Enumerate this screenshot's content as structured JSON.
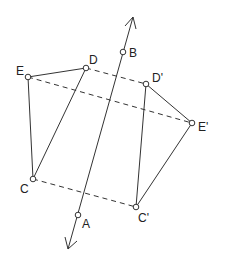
{
  "diagram": {
    "type": "reflection-across-line",
    "mirror_line": {
      "arrow_top": [
        133,
        17
      ],
      "arrow_bottom": [
        68,
        249
      ],
      "points_on_line": [
        "A",
        "B"
      ]
    },
    "points": {
      "A": {
        "label": "A",
        "x": 78,
        "y": 215
      },
      "B": {
        "label": "B",
        "x": 123,
        "y": 52
      },
      "C": {
        "label": "C",
        "x": 33,
        "y": 179
      },
      "D": {
        "label": "D",
        "x": 86,
        "y": 68
      },
      "E": {
        "label": "E",
        "x": 28,
        "y": 77
      },
      "C_prime": {
        "label": "C'",
        "x": 136,
        "y": 207
      },
      "D_prime": {
        "label": "D'",
        "x": 146,
        "y": 84
      },
      "E_prime": {
        "label": "E'",
        "x": 192,
        "y": 123
      }
    },
    "original_triangle": [
      "C",
      "D",
      "E"
    ],
    "image_triangle": [
      "C'",
      "D'",
      "E'"
    ],
    "dashed_connectors": [
      [
        "D",
        "D'"
      ],
      [
        "E",
        "E'"
      ],
      [
        "C",
        "C'"
      ]
    ]
  }
}
